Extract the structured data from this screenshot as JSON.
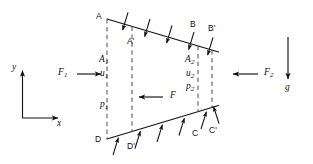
{
  "figure": {
    "colors": {
      "stroke": "#111111",
      "dashed": "#555555",
      "background": "#ffffff"
    },
    "vertices": {
      "A": "A",
      "A_prime": "A'",
      "B": "B",
      "B_prime": "B'",
      "C": "C",
      "C_prime": "C'",
      "D": "D",
      "D_prime": "D'"
    },
    "left_face": {
      "area": "A",
      "area_sub": "1",
      "velocity": "u",
      "velocity_sub": "1",
      "pressure": "p",
      "pressure_sub": "1",
      "force": "F",
      "force_sub": "1"
    },
    "right_face": {
      "area": "A",
      "area_sub": "2",
      "velocity": "u",
      "velocity_sub": "2",
      "pressure": "p",
      "pressure_sub": "2",
      "force": "F",
      "force_sub": "2"
    },
    "wall_force": {
      "label": "F"
    },
    "gravity": {
      "label": "g"
    },
    "axes": {
      "x_label": "x",
      "y_label": "y"
    }
  }
}
